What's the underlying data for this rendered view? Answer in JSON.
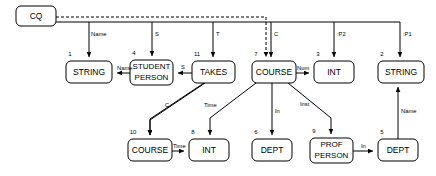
{
  "diagram": {
    "colors": {
      "background": "#ffffff",
      "stroke": "#000000",
      "text": "#000000"
    },
    "root": {
      "id": "cq",
      "label": "CQ",
      "x": 16,
      "y": 6,
      "w": 40,
      "h": 20
    },
    "nodes": [
      {
        "id": "n1",
        "index": "1",
        "label": "STRING",
        "line2": "",
        "x": 66,
        "y": 61,
        "w": 46,
        "h": 22
      },
      {
        "id": "n4",
        "index": "4",
        "label": "STUDENT",
        "line2": "PERSON",
        "x": 130,
        "y": 60,
        "w": 43,
        "h": 24
      },
      {
        "id": "n11",
        "index": "11",
        "label": "TAKES",
        "line2": "",
        "x": 192,
        "y": 61,
        "w": 43,
        "h": 22
      },
      {
        "id": "n7",
        "index": "7",
        "label": "COURSE",
        "line2": "",
        "x": 252,
        "y": 61,
        "w": 44,
        "h": 22
      },
      {
        "id": "n3",
        "index": "3",
        "label": "INT",
        "line2": "",
        "x": 314,
        "y": 61,
        "w": 40,
        "h": 22
      },
      {
        "id": "n2",
        "index": "2",
        "label": "STRING",
        "line2": "",
        "x": 378,
        "y": 61,
        "w": 46,
        "h": 22
      },
      {
        "id": "n10",
        "index": "10",
        "label": "COURSE",
        "line2": "",
        "x": 128,
        "y": 139,
        "w": 44,
        "h": 22
      },
      {
        "id": "n8",
        "index": "8",
        "label": "INT",
        "line2": "",
        "x": 189,
        "y": 139,
        "w": 40,
        "h": 22
      },
      {
        "id": "n6",
        "index": "6",
        "label": "DEPT",
        "line2": "",
        "x": 252,
        "y": 139,
        "w": 40,
        "h": 22
      },
      {
        "id": "n9",
        "index": "9",
        "label": "PROF",
        "line2": "PERSON",
        "x": 310,
        "y": 138,
        "w": 43,
        "h": 24
      },
      {
        "id": "n5",
        "index": "5",
        "label": "DEPT",
        "line2": "",
        "x": 378,
        "y": 139,
        "w": 40,
        "h": 22
      }
    ],
    "edges": [
      {
        "id": "e-cq-name",
        "label": "Name",
        "label_x": 91,
        "label_y": 34,
        "from": "cq",
        "to": "n1",
        "style": "solid"
      },
      {
        "id": "e-cq-s",
        "label": "S",
        "label_x": 155,
        "label_y": 34,
        "from": "cq",
        "to": "n4",
        "style": "solid"
      },
      {
        "id": "e-cq-t",
        "label": "T",
        "label_x": 216,
        "label_y": 34,
        "from": "cq",
        "to": "n11",
        "style": "solid"
      },
      {
        "id": "e-cq-c",
        "label": "C",
        "label_x": 278,
        "label_y": 34,
        "from": "cq",
        "to": "n7",
        "style": "dashed"
      },
      {
        "id": "e-cq-p2",
        "label": ":P2",
        "label_x": 338,
        "label_y": 34,
        "from": "cq",
        "to": "n3",
        "style": "solid"
      },
      {
        "id": "e-cq-p1",
        "label": ":P1",
        "label_x": 402,
        "label_y": 34,
        "from": "cq",
        "to": "n2",
        "style": "solid"
      },
      {
        "id": "e-n4-name",
        "label": "Name",
        "label_x": 114,
        "label_y": 68,
        "from": "n4",
        "to": "n1",
        "style": "solid"
      },
      {
        "id": "e-n11-s",
        "label": "S",
        "label_x": 180,
        "label_y": 66,
        "from": "n11",
        "to": "n4",
        "style": "solid"
      },
      {
        "id": "e-n7-num",
        "label": "Num",
        "label_x": 300,
        "label_y": 68,
        "from": "n7",
        "to": "n3",
        "style": "solid"
      },
      {
        "id": "e-n11-c",
        "label": "C",
        "label_x": 166,
        "label_y": 110,
        "from": "n11",
        "to": "n10",
        "style": "solid"
      },
      {
        "id": "e-n11-time",
        "label": "Time",
        "label_x": 208,
        "label_y": 108,
        "from": "n11",
        "to": "n8",
        "style": "solid"
      },
      {
        "id": "e-n7-in",
        "label": "In",
        "label_x": 275,
        "label_y": 113,
        "from": "n7",
        "to": "n6",
        "style": "solid"
      },
      {
        "id": "e-n7-inst",
        "label": "Inst",
        "label_x": 304,
        "label_y": 107,
        "from": "n7",
        "to": "n9",
        "style": "solid"
      },
      {
        "id": "e-n10-time",
        "label": "Time",
        "label_x": 178,
        "label_y": 146,
        "from": "n10",
        "to": "n8",
        "style": "solid"
      },
      {
        "id": "e-n9-in",
        "label": "In",
        "label_x": 366,
        "label_y": 146,
        "from": "n9",
        "to": "n5",
        "style": "solid"
      },
      {
        "id": "e-n5-name",
        "label": "Name",
        "label_x": 402,
        "label_y": 113,
        "from": "n5",
        "to": "n2",
        "style": "solid"
      }
    ]
  }
}
